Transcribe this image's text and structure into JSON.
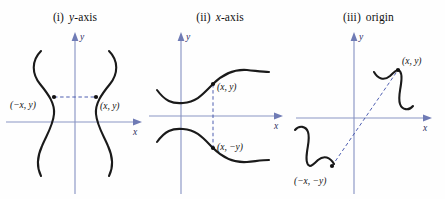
{
  "figure": {
    "caption_style": "three coordinate-plane diagrams of curve symmetry"
  },
  "colors": {
    "axis": "#8a95c4",
    "curve": "#1a1a1a",
    "connector": "#3b4da8",
    "label": "#111111",
    "background": "#fefefe"
  },
  "panels": [
    {
      "numeral": "(i)",
      "title": "y-axis",
      "title_var": "y",
      "title_rest": "-axis",
      "axis_x_label": "x",
      "axis_y_label": "y",
      "points": [
        {
          "label": "(−x, y)"
        },
        {
          "label": "(x, y)"
        }
      ],
      "connector_kind": "horizontal-dashed"
    },
    {
      "numeral": "(ii)",
      "title": "x-axis",
      "title_var": "x",
      "title_rest": "-axis",
      "axis_x_label": "x",
      "axis_y_label": "y",
      "points": [
        {
          "label": "(x, y)"
        },
        {
          "label": "(x, −y)"
        }
      ],
      "connector_kind": "vertical-dashed"
    },
    {
      "numeral": "(iii)",
      "title": "origin",
      "title_var": "",
      "title_rest": "origin",
      "axis_x_label": "x",
      "axis_y_label": "y",
      "points": [
        {
          "label": "(x, y)"
        },
        {
          "label": "(−x, −y)"
        }
      ],
      "connector_kind": "diagonal-dashed"
    }
  ]
}
